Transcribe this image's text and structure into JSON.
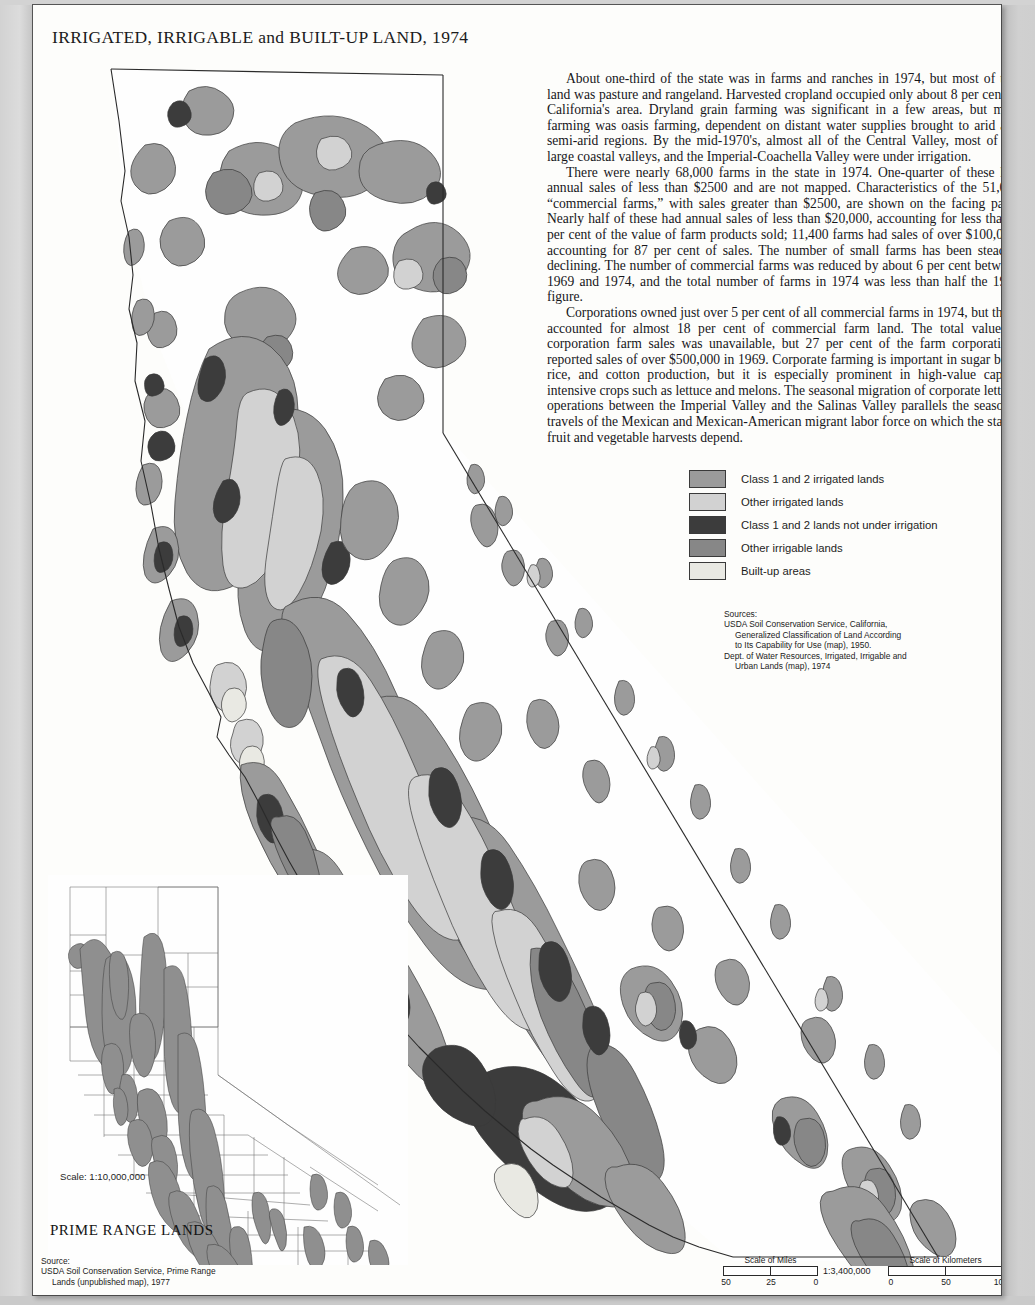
{
  "page": {
    "title": "IRRIGATED, IRRIGABLE and BUILT-UP LAND, 1974",
    "background_color": "#fdfdfb",
    "margin_color": "#cfcfcf"
  },
  "narrative": {
    "paragraphs": [
      "About one-third of the state was in farms and ranches in 1974, but most of this land was pasture and rangeland. Harvested cropland occupied only about 8 per cent of California's area. Dryland grain farming was significant in a few areas, but most farming was oasis farming, dependent on distant water supplies brought to arid and semi-arid regions. By the mid-1970's, almost all of the Central Valley, most of the large coastal valleys, and the Imperial-Coachella Valley were under irrigation.",
      "There were nearly 68,000 farms in the state in 1974. One-quarter of these had annual sales of less than $2500 and are not mapped. Characteristics of the 51,000 “commercial farms,” with sales greater than $2500, are shown on the facing page. Nearly half of these had annual sales of less than $20,000, accounting for less than 3 per cent of the value of farm products sold; 11,400 farms had sales of over $100,000, accounting for 87 per cent of sales. The number of small farms has been steadily declining. The number of commercial farms was reduced by about 6 per cent between 1969 and 1974, and the total number of farms in 1974 was less than half the 1950 figure.",
      "Corporations owned just over 5 per cent of all commercial farms in 1974, but these accounted for almost 18 per cent of commercial farm land. The total value of corporation farm sales was unavailable, but 27 per cent of the farm corporations reported sales of over $500,000 in 1969. Corporate farming is important in sugar beet, rice, and cotton production, but it is especially prominent in high-value capital intensive crops such as lettuce and melons. The seasonal migration of corporate lettuce operations between the Imperial Valley and the Salinas Valley parallels the seasonal travels of the Mexican and Mexican-American migrant labor force on which the state's fruit and vegetable harvests depend."
    ]
  },
  "legend": {
    "items": [
      {
        "label": "Class 1 and 2 irrigated lands",
        "color": "#9b9b9b"
      },
      {
        "label": "Other irrigated lands",
        "color": "#d2d2d2"
      },
      {
        "label": "Class 1 and 2 lands not under irrigation",
        "color": "#3c3c3c"
      },
      {
        "label": "Other irrigable lands",
        "color": "#878787"
      },
      {
        "label": "Built-up areas",
        "color": "#e9e9e3"
      }
    ]
  },
  "sources_right": {
    "heading": "Sources:",
    "lines": [
      "USDA Soil Conservation Service, California,",
      "Generalized Classification of Land According",
      "to Its Capability for Use (map), 1950.",
      "Dept. of Water Resources, Irrigated, Irrigable and",
      "Urban Lands (map), 1974"
    ]
  },
  "inset": {
    "scale_label": "Scale: 1:10,000,000",
    "title": "PRIME RANGE LANDS",
    "source_heading": "Source:",
    "source_lines": [
      "USDA Soil Conservation Service, Prime Range",
      "Lands (unpublished map), 1977"
    ],
    "shade_color": "#8f8f8f"
  },
  "scale": {
    "representative_fraction": "1:3,400,000",
    "miles": {
      "caption": "Scale of Miles",
      "ticks": [
        "50",
        "25",
        "0"
      ]
    },
    "kilometers": {
      "caption": "Scale of Kilometers",
      "ticks": [
        "0",
        "50",
        "100"
      ]
    }
  }
}
